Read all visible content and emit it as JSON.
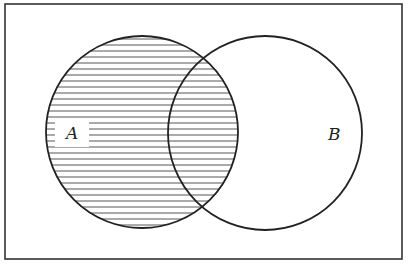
{
  "diagram": {
    "type": "venn",
    "universe": {
      "x": 5,
      "y": 4,
      "width": 397,
      "height": 255,
      "stroke": "#333333"
    },
    "sets": [
      {
        "id": "A",
        "label": "A",
        "cx": 142,
        "cy": 132,
        "r": 96,
        "shaded": true,
        "label_x": 72,
        "label_y": 139
      },
      {
        "id": "B",
        "label": "B",
        "cx": 265,
        "cy": 133,
        "r": 97,
        "shaded": false,
        "label_x": 334,
        "label_y": 140
      }
    ],
    "shaded_region": "A",
    "shading_style": "horizontal-hatch",
    "hatch_spacing": 6,
    "colors": {
      "stroke": "#222222",
      "hatch": "#555555",
      "background": "#ffffff"
    }
  }
}
